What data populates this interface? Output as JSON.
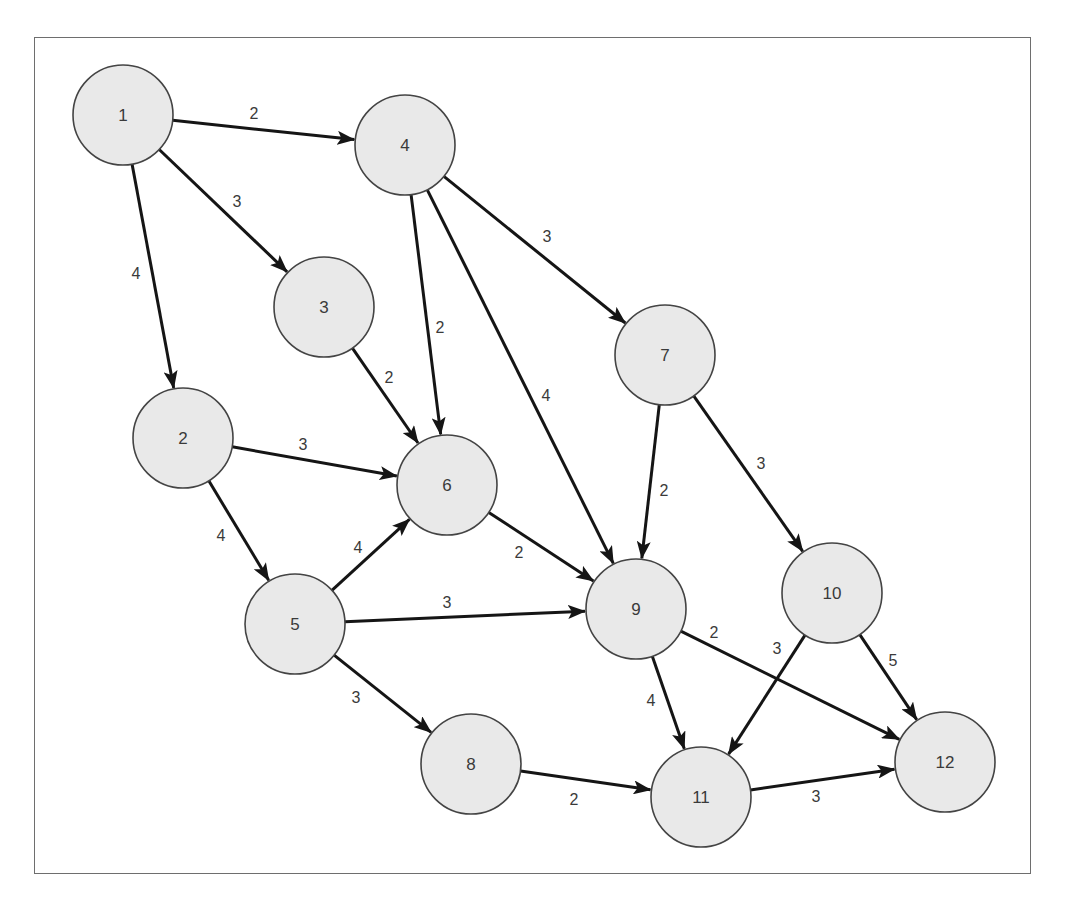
{
  "diagram": {
    "type": "directed-weighted-network",
    "colors": {
      "node_fill": "#e9e9e9",
      "node_stroke": "#444444",
      "edge": "#151515",
      "text": "#3a3a3a",
      "frame": "#6e6e6e"
    },
    "node_radius": 50,
    "nodes": [
      {
        "id": "1",
        "label": "1",
        "x": 123,
        "y": 115
      },
      {
        "id": "2",
        "label": "2",
        "x": 183,
        "y": 438
      },
      {
        "id": "3",
        "label": "3",
        "x": 324,
        "y": 307
      },
      {
        "id": "4",
        "label": "4",
        "x": 405,
        "y": 145
      },
      {
        "id": "5",
        "label": "5",
        "x": 295,
        "y": 624
      },
      {
        "id": "6",
        "label": "6",
        "x": 447,
        "y": 485
      },
      {
        "id": "7",
        "label": "7",
        "x": 665,
        "y": 355
      },
      {
        "id": "8",
        "label": "8",
        "x": 471,
        "y": 764
      },
      {
        "id": "9",
        "label": "9",
        "x": 636,
        "y": 609
      },
      {
        "id": "10",
        "label": "10",
        "x": 832,
        "y": 593
      },
      {
        "id": "11",
        "label": "11",
        "x": 701,
        "y": 797
      },
      {
        "id": "12",
        "label": "12",
        "x": 945,
        "y": 762
      }
    ],
    "edges": [
      {
        "from": "1",
        "to": "4",
        "weight": "2",
        "label_x": 254,
        "label_y": 113
      },
      {
        "from": "1",
        "to": "3",
        "weight": "3",
        "label_x": 237,
        "label_y": 201
      },
      {
        "from": "1",
        "to": "2",
        "weight": "4",
        "label_x": 136,
        "label_y": 273
      },
      {
        "from": "4",
        "to": "6",
        "weight": "2",
        "label_x": 440,
        "label_y": 327
      },
      {
        "from": "4",
        "to": "9",
        "weight": "4",
        "label_x": 546,
        "label_y": 395
      },
      {
        "from": "4",
        "to": "7",
        "weight": "3",
        "label_x": 547,
        "label_y": 236
      },
      {
        "from": "3",
        "to": "6",
        "weight": "2",
        "label_x": 389,
        "label_y": 377
      },
      {
        "from": "2",
        "to": "6",
        "weight": "3",
        "label_x": 303,
        "label_y": 444
      },
      {
        "from": "2",
        "to": "5",
        "weight": "4",
        "label_x": 221,
        "label_y": 535
      },
      {
        "from": "5",
        "to": "6",
        "weight": "4",
        "label_x": 358,
        "label_y": 547
      },
      {
        "from": "5",
        "to": "9",
        "weight": "3",
        "label_x": 447,
        "label_y": 602
      },
      {
        "from": "5",
        "to": "8",
        "weight": "3",
        "label_x": 356,
        "label_y": 697
      },
      {
        "from": "6",
        "to": "9",
        "weight": "2",
        "label_x": 519,
        "label_y": 552
      },
      {
        "from": "7",
        "to": "9",
        "weight": "2",
        "label_x": 664,
        "label_y": 490
      },
      {
        "from": "7",
        "to": "10",
        "weight": "3",
        "label_x": 761,
        "label_y": 463
      },
      {
        "from": "9",
        "to": "11",
        "weight": "4",
        "label_x": 651,
        "label_y": 700
      },
      {
        "from": "9",
        "to": "12",
        "weight": "2",
        "label_x": 714,
        "label_y": 632
      },
      {
        "from": "10",
        "to": "11",
        "weight": "3",
        "label_x": 777,
        "label_y": 648
      },
      {
        "from": "10",
        "to": "12",
        "weight": "5",
        "label_x": 893,
        "label_y": 660
      },
      {
        "from": "8",
        "to": "11",
        "weight": "2",
        "label_x": 574,
        "label_y": 799
      },
      {
        "from": "11",
        "to": "12",
        "weight": "3",
        "label_x": 816,
        "label_y": 796
      }
    ]
  }
}
